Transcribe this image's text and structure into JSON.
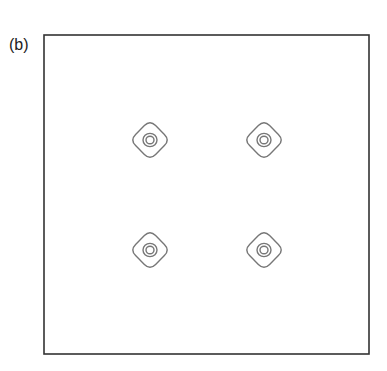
{
  "figure": {
    "panel_label": "(b)"
  },
  "chart_data": {
    "type": "contour",
    "title": "",
    "panel_label": "(b)",
    "xlabel": "",
    "ylabel": "",
    "axes_ticks": false,
    "grid": false,
    "legend": null,
    "frame": {
      "x0": 44,
      "y0": 35,
      "x1": 369,
      "y1": 354
    },
    "peaks": [
      {
        "id": "top-left",
        "cx": 150,
        "cy": 140
      },
      {
        "id": "top-right",
        "cx": 264,
        "cy": 140
      },
      {
        "id": "bottom-left",
        "cx": 150,
        "cy": 250
      },
      {
        "id": "bottom-right",
        "cx": 264,
        "cy": 250
      }
    ],
    "contour_levels": [
      {
        "level": "outer",
        "shape": "rounded-diamond",
        "half_width": 20
      },
      {
        "level": "middle",
        "shape": "circle",
        "radius": 7
      },
      {
        "level": "inner",
        "shape": "circle",
        "radius": 4
      }
    ],
    "line_color": "#777777",
    "frame_color": "#333333"
  }
}
